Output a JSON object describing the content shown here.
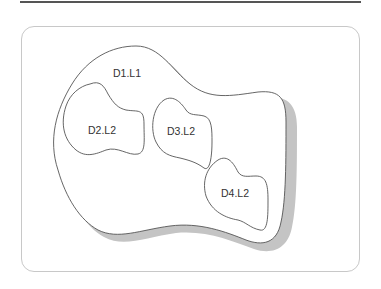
{
  "diagram": {
    "type": "nested-region-diagram",
    "regions": [
      {
        "id": "D1.L1",
        "label": "D1.L1",
        "level": 1,
        "contains": [
          "D2.L2",
          "D3.L2",
          "D4.L2"
        ]
      },
      {
        "id": "D2.L2",
        "label": "D2.L2",
        "level": 2
      },
      {
        "id": "D3.L2",
        "label": "D3.L2",
        "level": 2
      },
      {
        "id": "D4.L2",
        "label": "D4.L2",
        "level": 2
      }
    ],
    "colors": {
      "stroke": "#555555",
      "shadow": "#c4c4c4",
      "frame": "#c8c8c8",
      "rule": "#555555",
      "text": "#333333"
    }
  }
}
